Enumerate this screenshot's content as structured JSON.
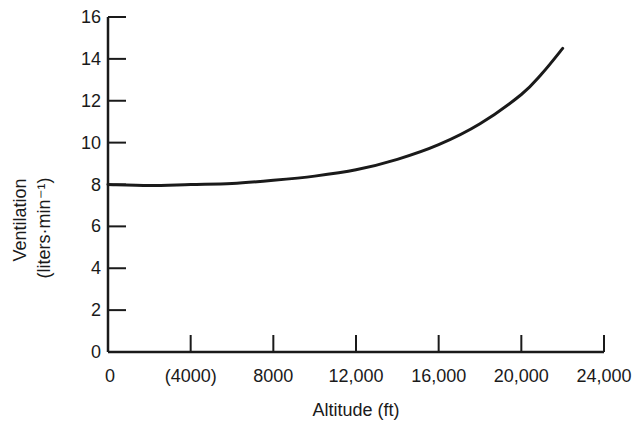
{
  "chart_data": {
    "type": "line",
    "title": "",
    "xlabel": "Altitude (ft)",
    "ylabel": "Ventilation",
    "ylabel_units": "(liters·min⁻¹)",
    "xlim": [
      0,
      24000
    ],
    "ylim": [
      0,
      16
    ],
    "grid": false,
    "legend": null,
    "x_ticks": [
      0,
      4000,
      8000,
      12000,
      16000,
      20000,
      24000
    ],
    "x_tick_labels": [
      "0",
      "(4000)",
      "8000",
      "12,000",
      "16,000",
      "20,000",
      "24,000"
    ],
    "y_ticks": [
      0,
      2,
      4,
      6,
      8,
      10,
      12,
      14,
      16
    ],
    "y_tick_labels": [
      "0",
      "2",
      "4",
      "6",
      "8",
      "10",
      "12",
      "14",
      "16"
    ],
    "series": [
      {
        "name": "Ventilation",
        "x": [
          0,
          2000,
          4000,
          6000,
          8000,
          10000,
          12000,
          14000,
          16000,
          18000,
          20000,
          21000,
          22000
        ],
        "values": [
          8.0,
          7.95,
          8.0,
          8.05,
          8.2,
          8.4,
          8.7,
          9.2,
          9.9,
          10.9,
          12.3,
          13.3,
          14.5
        ]
      }
    ]
  }
}
